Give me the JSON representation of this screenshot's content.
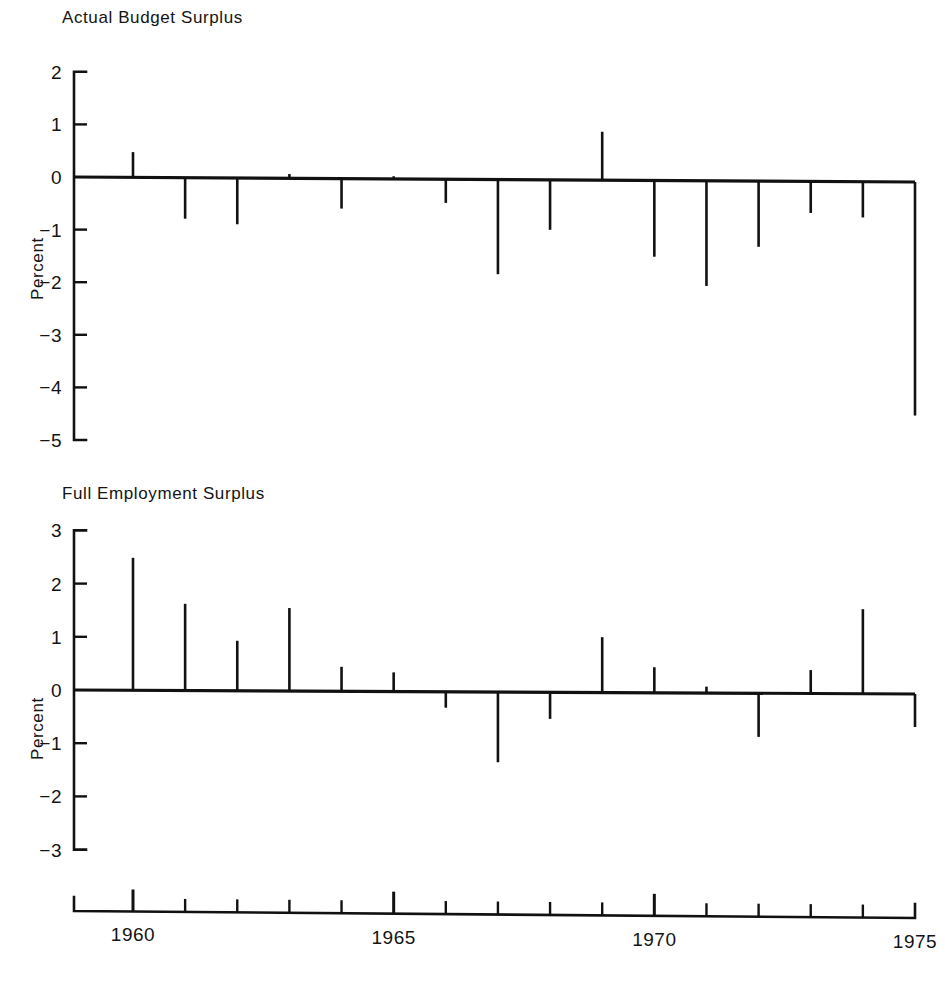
{
  "figure": {
    "y_axis_label": "Percent",
    "panels": [
      {
        "title": "Actual Budget Surplus",
        "y_ticks": [
          "2",
          "1",
          "0",
          "−1",
          "−2",
          "−3",
          "−4",
          "−5"
        ]
      },
      {
        "title": "Full Employment Surplus",
        "y_ticks": [
          "3",
          "2",
          "1",
          "0",
          "−1",
          "−2",
          "−3"
        ]
      }
    ],
    "x_axis": {
      "labels": [
        "1960",
        "1965",
        "1970",
        "1975"
      ],
      "label_years": [
        1960,
        1965,
        1970,
        1975
      ],
      "minor_years": [
        1961,
        1962,
        1963,
        1964,
        1966,
        1967,
        1968,
        1969,
        1971,
        1972,
        1973,
        1974
      ],
      "start_edge_year": 1959,
      "end_edge_year": 1975
    }
  },
  "chart_data": [
    {
      "type": "bar",
      "title": "Actual Budget Surplus",
      "xlabel": "",
      "ylabel": "Percent",
      "ylim": [
        -5,
        2
      ],
      "yticks": [
        2,
        1,
        0,
        -1,
        -2,
        -3,
        -4,
        -5
      ],
      "xlim": [
        1959.3,
        1975.2
      ],
      "xticks": [
        1960,
        1965,
        1970,
        1975
      ],
      "grid": false,
      "legend": "none",
      "categories": [
        1960,
        1961,
        1962,
        1963,
        1964,
        1965,
        1966,
        1967,
        1968,
        1969,
        1970,
        1971,
        1972,
        1973,
        1974,
        1975
      ],
      "values": [
        0.48,
        -0.78,
        -0.88,
        0.08,
        -0.57,
        0.05,
        -0.45,
        -1.8,
        -0.95,
        0.92,
        -1.45,
        -2.0,
        -1.25,
        -0.6,
        -0.68,
        -4.44
      ]
    },
    {
      "type": "bar",
      "title": "Full Employment Surplus",
      "xlabel": "",
      "ylabel": "Percent",
      "ylim": [
        -3,
        3
      ],
      "yticks": [
        3,
        2,
        1,
        0,
        -1,
        -2,
        -3
      ],
      "xlim": [
        1959.3,
        1975.2
      ],
      "xticks": [
        1960,
        1965,
        1970,
        1975
      ],
      "grid": false,
      "legend": "none",
      "categories": [
        1960,
        1961,
        1962,
        1963,
        1964,
        1965,
        1966,
        1967,
        1968,
        1969,
        1970,
        1971,
        1972,
        1973,
        1974,
        1975
      ],
      "values": [
        2.49,
        1.63,
        0.94,
        1.56,
        0.46,
        0.36,
        -0.3,
        -1.32,
        -0.5,
        1.04,
        0.48,
        0.12,
        -0.82,
        0.44,
        1.59,
        -0.62
      ]
    }
  ]
}
